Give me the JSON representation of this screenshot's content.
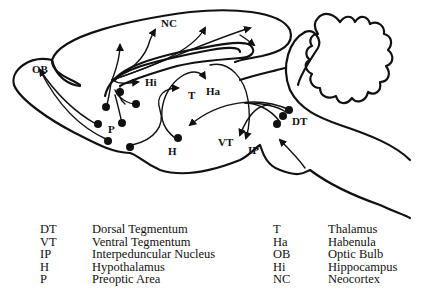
{
  "diagram": {
    "labels": {
      "NC": "NC",
      "OB": "OB",
      "Hi": "Hi",
      "T": "T",
      "Ha": "Ha",
      "P": "P",
      "H": "H",
      "VT": "VT",
      "IP": "IP",
      "DT": "DT"
    },
    "colors": {
      "ink": "#111111",
      "background": "#ffffff"
    }
  },
  "legend": {
    "left": [
      {
        "abbr": "DT",
        "name": "Dorsal Tegmentum"
      },
      {
        "abbr": "VT",
        "name": "Ventral Tegmentum"
      },
      {
        "abbr": "IP",
        "name": "Interpeduncular Nucleus"
      },
      {
        "abbr": "H",
        "name": "Hypothalamus"
      },
      {
        "abbr": "P",
        "name": "Preoptic Area"
      }
    ],
    "right": [
      {
        "abbr": "T",
        "name": "Thalamus"
      },
      {
        "abbr": "Ha",
        "name": "Habenula"
      },
      {
        "abbr": "OB",
        "name": "Optic Bulb"
      },
      {
        "abbr": "Hi",
        "name": "Hippocampus"
      },
      {
        "abbr": "NC",
        "name": "Neocortex"
      }
    ]
  }
}
